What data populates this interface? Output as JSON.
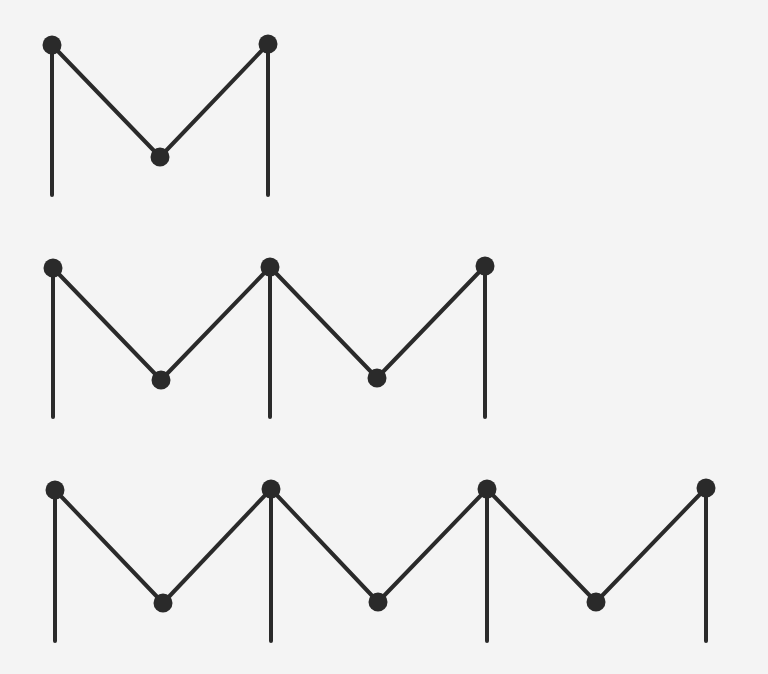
{
  "title": "",
  "colors": {
    "background": "#f4f4f4",
    "stroke": "#2a2a2a",
    "node": "#2a2a2a"
  },
  "style": {
    "stroke_width": 4,
    "node_radius": 9.5
  },
  "diagram": {
    "rows": [
      {
        "name": "row-1",
        "post_bottom_y": 195,
        "peaks": [
          [
            52,
            45
          ],
          [
            268,
            44
          ]
        ],
        "valleys": [
          [
            160,
            157
          ]
        ]
      },
      {
        "name": "row-2",
        "post_bottom_y": 417,
        "peaks": [
          [
            53,
            268
          ],
          [
            270,
            267
          ],
          [
            485,
            266
          ]
        ],
        "valleys": [
          [
            161,
            380
          ],
          [
            377,
            378
          ]
        ]
      },
      {
        "name": "row-3",
        "post_bottom_y": 641,
        "peaks": [
          [
            55,
            490
          ],
          [
            271,
            489
          ],
          [
            487,
            489
          ],
          [
            706,
            488
          ]
        ],
        "valleys": [
          [
            163,
            603
          ],
          [
            378,
            602
          ],
          [
            596,
            602
          ]
        ]
      }
    ]
  }
}
